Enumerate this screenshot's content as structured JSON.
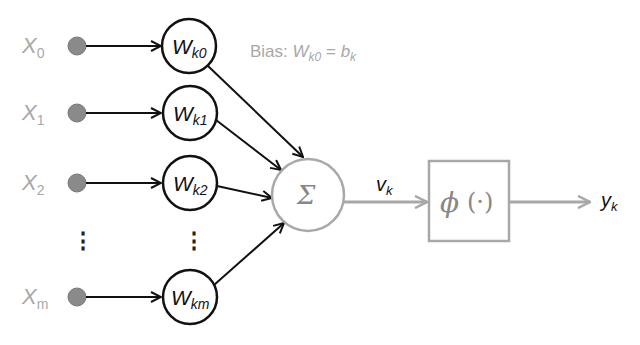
{
  "diagram": {
    "inputs": [
      {
        "base": "X",
        "sub": "0",
        "y": 46
      },
      {
        "base": "X",
        "sub": "1",
        "y": 113
      },
      {
        "base": "X",
        "sub": "2",
        "y": 183
      },
      {
        "base": "X",
        "sub": "m",
        "y": 297
      }
    ],
    "weights": [
      {
        "base": "W",
        "sub": "k0",
        "y": 46
      },
      {
        "base": "W",
        "sub": "k1",
        "y": 113
      },
      {
        "base": "W",
        "sub": "k2",
        "y": 183
      },
      {
        "base": "W",
        "sub": "km",
        "y": 297
      }
    ],
    "ellipsis": "⋮",
    "bias": {
      "prefix": "Bias: ",
      "w_base": "W",
      "w_sub": "k0",
      "eq": " = ",
      "b_base": "b",
      "b_sub": "k"
    },
    "summation": {
      "symbol": "Σ"
    },
    "induced_field": {
      "base": "v",
      "sub": "k"
    },
    "activation": {
      "symbol": "ϕ",
      "args": "(·)"
    },
    "output": {
      "base": "y",
      "sub": "k"
    },
    "colors": {
      "input_dot": "#8a8a8a",
      "gray_stroke": "#a8a8a8",
      "black_stroke": "#111111",
      "gray_text": "#a8a8a8"
    }
  }
}
